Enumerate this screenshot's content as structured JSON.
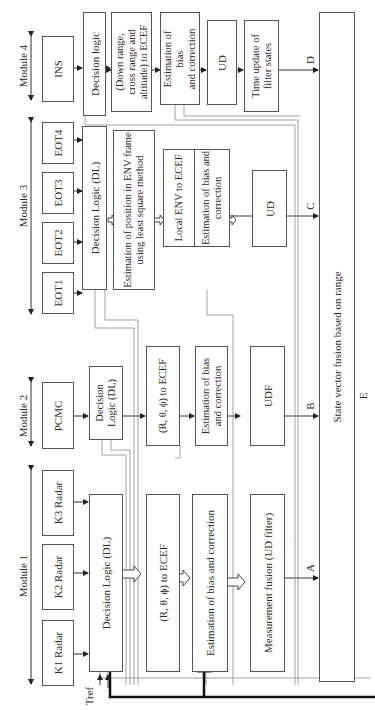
{
  "modules": [
    {
      "label": "Module 1",
      "inputs": [
        "K1 Radar",
        "K2 Radar",
        "K3 Radar"
      ]
    },
    {
      "label": "Module 2",
      "inputs": [
        "PCMC"
      ]
    },
    {
      "label": "Module 3",
      "inputs": [
        "EOT1",
        "EOT2",
        "EOT3",
        "EOT4"
      ]
    },
    {
      "label": "Module 4",
      "inputs": [
        "INS"
      ]
    }
  ],
  "module1": {
    "decision": "Decision Logic (DL)",
    "convert": "(R, θ, ϕ) to ECEF",
    "bias": "Estimation of bias and correction",
    "fusion": "Measurement fusion (UD filter)",
    "out": "A"
  },
  "module2": {
    "decision_l1": "Decision",
    "decision_l2": "Logic (DL)",
    "convert": "(R, θ, ϕ) to ECEF",
    "bias_l1": "Estimation of bias",
    "bias_l2": "and correction",
    "filter": "UDF",
    "out": "B"
  },
  "module3": {
    "decision": "Decision Logic (DL)",
    "estimate_l1": "Estimation of position in ENV frame",
    "estimate_l2": "using least square method",
    "local": "Local ENV to ECEF",
    "bias_l1": "Estimation of bias and",
    "bias_l2": "correction",
    "filter": "UD",
    "out": "C"
  },
  "module4": {
    "decision": "Decision logic",
    "convert_l1": "(Down range,",
    "convert_l2": "cross range and",
    "convert_l3": "altitude) to ECEF",
    "bias_l1": "Estimation of",
    "bias_l2": "bias",
    "bias_l3": "and correction",
    "filter": "UD",
    "time_l1": "Time update of",
    "time_l2": "filter states",
    "out": "D"
  },
  "fusion_block": {
    "label": "State vector fusion based on range",
    "out": "E"
  },
  "tref": "Tref"
}
